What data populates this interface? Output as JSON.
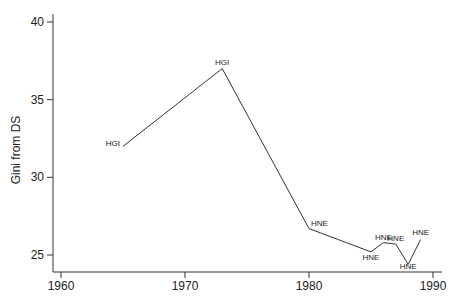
{
  "chart_data": {
    "type": "line",
    "title": "",
    "xlabel": "",
    "ylabel": "Gini from DS",
    "xlim": [
      1959.2,
      1990.7
    ],
    "ylim": [
      23.9,
      41.0
    ],
    "xticks": [
      1960,
      1970,
      1980,
      1990
    ],
    "yticks": [
      25,
      30,
      35,
      40
    ],
    "grid": false,
    "legend": null,
    "series": [
      {
        "name": "Gini from DS",
        "color": "#333333",
        "points": [
          {
            "x": 1965,
            "y": 32.0,
            "label": "HGI"
          },
          {
            "x": 1973,
            "y": 37.0,
            "label": "HGI"
          },
          {
            "x": 1980,
            "y": 26.7,
            "label": "HNE"
          },
          {
            "x": 1985,
            "y": 25.2,
            "label": "HNE"
          },
          {
            "x": 1986,
            "y": 25.8,
            "label": "HNE"
          },
          {
            "x": 1987,
            "y": 25.7,
            "label": "HNE"
          },
          {
            "x": 1988,
            "y": 24.4,
            "label": "HNE"
          },
          {
            "x": 1989,
            "y": 26.0,
            "label": "HNE"
          }
        ]
      }
    ]
  },
  "labels": {
    "ylabel": "Gini from DS",
    "xtick_labels": [
      "1960",
      "1970",
      "1980",
      "1990"
    ],
    "ytick_labels": [
      "25",
      "30",
      "35",
      "40"
    ]
  }
}
